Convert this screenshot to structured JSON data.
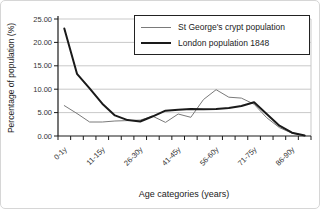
{
  "window": {
    "width": 320,
    "height": 209
  },
  "colors": {
    "background": "#ffffff",
    "grid": "#c9c9c9",
    "axis": "#1a1a1a",
    "tick_text": "#333333",
    "series_crypt": "#7a7a7a",
    "series_london": "#1a1a1a",
    "legend_border": "#222222"
  },
  "chart_data": {
    "type": "line",
    "title": "",
    "xlabel": "Age categories (years)",
    "ylabel": "Percentage of population (%)",
    "categories": [
      "0-1y",
      "2-5y",
      "6-10y",
      "11-15y",
      "16-20y",
      "21-25y",
      "26-30y",
      "31-35y",
      "36-40y",
      "41-45y",
      "46-50y",
      "51-55y",
      "56-60y",
      "61-65y",
      "66-70y",
      "71-75y",
      "76-80y",
      "81-85y",
      "86-90y",
      "91-95y"
    ],
    "x_labeled_every": 3,
    "visible_x_labels": [
      "0-1y",
      "11-15y",
      "26-30y",
      "41-45y",
      "56-60y",
      "71-75y",
      "86-90y"
    ],
    "ylim": [
      0,
      25
    ],
    "y_ticks": [
      0,
      5,
      10,
      15,
      20,
      25
    ],
    "y_tick_labels": [
      "0.00",
      "5.00",
      "10.00",
      "15.00",
      "20.00",
      "25.00"
    ],
    "grid": "horizontal",
    "legend_position": "top-right",
    "series": [
      {
        "name": "St George's crypt population",
        "color": "#7a7a7a",
        "width": 1,
        "values": [
          6.5,
          4.8,
          3.0,
          3.0,
          3.2,
          3.3,
          3.4,
          4.2,
          2.9,
          4.7,
          4.0,
          7.8,
          9.9,
          8.3,
          8.1,
          6.8,
          3.9,
          1.8,
          0.6,
          0.1
        ]
      },
      {
        "name": "London population 1848",
        "color": "#1a1a1a",
        "width": 2,
        "values": [
          23.0,
          13.3,
          10.2,
          6.9,
          4.4,
          3.4,
          3.1,
          4.2,
          5.4,
          5.6,
          5.8,
          5.7,
          5.8,
          6.0,
          6.4,
          7.2,
          4.7,
          2.2,
          0.7,
          0.1
        ]
      }
    ]
  }
}
